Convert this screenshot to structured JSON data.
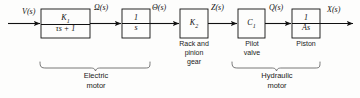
{
  "figure": {
    "type": "block-diagram",
    "title": "",
    "background_color": "#fdfdfc",
    "line_color": "#111111"
  },
  "signals": {
    "input": "V(s)",
    "s1": "Ω(s)",
    "s2": "Θ(s)",
    "s3": "Z(s)",
    "s4": "Q(s)",
    "output": "X(s)"
  },
  "blocks": [
    {
      "id": "first-order-lag",
      "numerator": "K",
      "numerator_sub": "1",
      "denominator": "τs + 1",
      "caption": ""
    },
    {
      "id": "integrator",
      "numerator": "1",
      "denominator": "s",
      "caption": ""
    },
    {
      "id": "gear-gain",
      "expression": "K",
      "expression_sub": "2",
      "caption": "Rack and\npinion\ngear"
    },
    {
      "id": "pilot-valve-gain",
      "expression": "C",
      "expression_sub": "1",
      "caption": "Pilot\nvalve"
    },
    {
      "id": "piston-integrator",
      "numerator": "1",
      "denominator": "As",
      "caption": "Piston"
    }
  ],
  "groups": [
    {
      "id": "electric-motor",
      "label": "Electric\nmotor"
    },
    {
      "id": "hydraulic-motor",
      "label": "Hydraulic\nmotor"
    }
  ]
}
